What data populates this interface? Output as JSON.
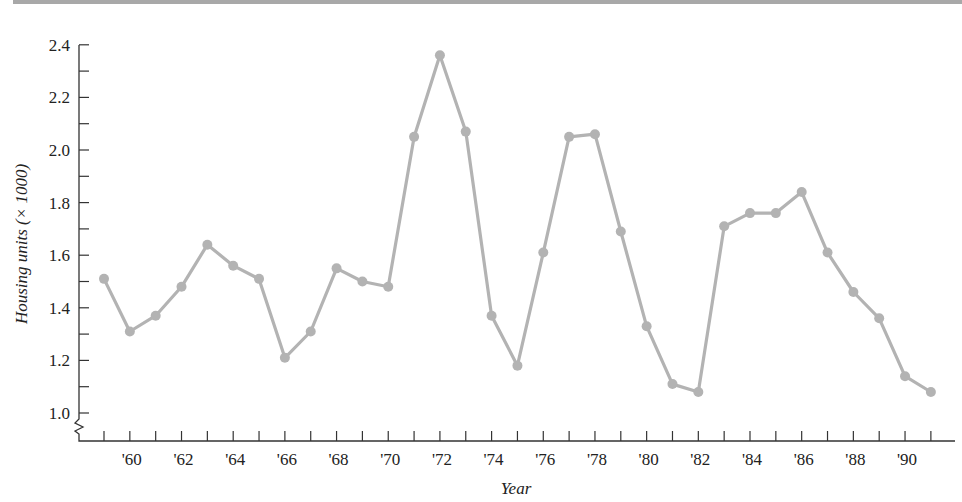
{
  "chart_data": {
    "type": "line",
    "title": "",
    "xlabel": "Year",
    "ylabel": "Housing units (× 1000)",
    "x": [
      1959,
      1960,
      1961,
      1962,
      1963,
      1964,
      1965,
      1966,
      1967,
      1968,
      1969,
      1970,
      1971,
      1972,
      1973,
      1974,
      1975,
      1976,
      1977,
      1978,
      1979,
      1980,
      1981,
      1982,
      1983,
      1984,
      1985,
      1986,
      1987,
      1988,
      1989,
      1990,
      1991
    ],
    "series": [
      {
        "name": "Housing units",
        "values": [
          1.51,
          1.31,
          1.37,
          1.48,
          1.64,
          1.56,
          1.51,
          1.21,
          1.31,
          1.55,
          1.5,
          1.48,
          2.05,
          2.36,
          2.07,
          1.37,
          1.18,
          1.61,
          2.05,
          2.06,
          1.69,
          1.33,
          1.11,
          1.08,
          1.71,
          1.76,
          1.76,
          1.84,
          1.61,
          1.46,
          1.36,
          1.14,
          1.08
        ]
      }
    ],
    "xtick_labels": [
      "'60",
      "'62",
      "'64",
      "'66",
      "'68",
      "'70",
      "'72",
      "'74",
      "'76",
      "'78",
      "'80",
      "'82",
      "'84",
      "'86",
      "'88",
      "'90"
    ],
    "xtick_years": [
      1960,
      1962,
      1964,
      1966,
      1968,
      1970,
      1972,
      1974,
      1976,
      1978,
      1980,
      1982,
      1984,
      1986,
      1988,
      1990
    ],
    "ytick_labels": [
      "1.0",
      "1.2",
      "1.4",
      "1.6",
      "1.8",
      "2.0",
      "2.2",
      "2.4"
    ],
    "ytick_values": [
      1.0,
      1.2,
      1.4,
      1.6,
      1.8,
      2.0,
      2.2,
      2.4
    ],
    "ylim": [
      1.0,
      2.4
    ],
    "xlim": [
      1958,
      1992
    ],
    "axis_break": true,
    "grid": false,
    "legend": null,
    "colors": {
      "line": "#b3b3b3",
      "marker": "#b3b3b3",
      "axis": "#333333",
      "top_bar": "#a8a8a8"
    }
  }
}
